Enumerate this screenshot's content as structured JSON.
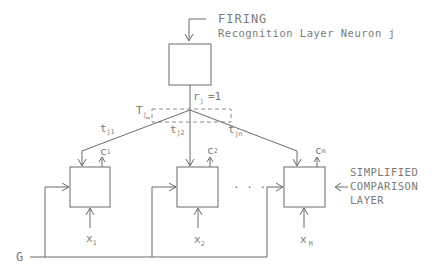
{
  "title": {
    "firing": "FIRING",
    "neuron": "Recognition Layer Neuron j"
  },
  "recognition": {
    "output_label": "r",
    "output_sub": "j",
    "output_value": "=1",
    "weight_group_label": "T",
    "weight_group_sub": "j"
  },
  "weights": [
    {
      "label": "t",
      "sub": "j1"
    },
    {
      "label": "t",
      "sub": "j2"
    },
    {
      "label": "t",
      "sub": "jn"
    }
  ],
  "comparison": {
    "layer_label_lines": [
      "SIMPLIFIED",
      "COMPARISON",
      "LAYER"
    ],
    "ellipsis": "· · ·",
    "nodes": [
      {
        "output_label": "c",
        "output_sub": "1",
        "input_label": "x",
        "input_sub": "1"
      },
      {
        "output_label": "c",
        "output_sub": "2",
        "input_label": "x",
        "input_sub": "2"
      },
      {
        "output_label": "c",
        "output_sub": "m",
        "input_label": "x",
        "input_sub": "M"
      }
    ]
  },
  "gain": {
    "label": "G"
  },
  "colors": {
    "line": "#6a6a6a",
    "text": "#7a7a7a",
    "background": "#ffffff"
  }
}
